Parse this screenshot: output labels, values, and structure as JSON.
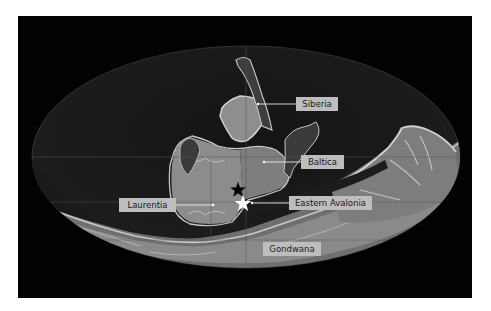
{
  "map": {
    "projection": "mollweide-like ellipse",
    "labels": [
      {
        "id": "siberia",
        "text": "Siberia"
      },
      {
        "id": "baltica",
        "text": "Baltica"
      },
      {
        "id": "laurentia",
        "text": "Laurentia"
      },
      {
        "id": "eastern_avalonia",
        "text": "Eastern Avalonia"
      },
      {
        "id": "gondwana",
        "text": "Gondwana"
      }
    ],
    "markers": [
      {
        "id": "black-star",
        "symbol": "★",
        "color": "#000000"
      },
      {
        "id": "white-star",
        "symbol": "★",
        "color": "#ffffff"
      }
    ],
    "colors": {
      "background": "#020202",
      "ocean_deep": "#0d0d0d",
      "ocean_shelf": "#262626",
      "land_low": "#7a7a7a",
      "land_high": "#9e9e9e",
      "coast_highlight": "#c8c8c8",
      "label_bg": "#bdbdbd"
    }
  }
}
